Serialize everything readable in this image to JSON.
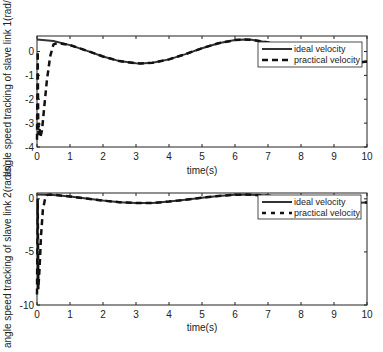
{
  "chart_data": [
    {
      "type": "line",
      "title": "",
      "xlabel": "time(s)",
      "ylabel": "angle speed tracking of slave link 1(rad/s)",
      "xlim": [
        0,
        10
      ],
      "ylim": [
        -4,
        0.65
      ],
      "xticks": [
        0,
        1,
        2,
        3,
        4,
        5,
        6,
        7,
        8,
        9,
        10
      ],
      "yticks": [
        0,
        -1,
        -2,
        -3,
        -4
      ],
      "grid": false,
      "legend_position": "upper right",
      "series": [
        {
          "name": "ideal velocity",
          "style": "solid",
          "x": [
            0,
            0.5,
            1,
            1.5,
            2,
            2.5,
            3,
            3.14,
            3.5,
            4,
            4.5,
            5,
            5.5,
            6,
            6.28,
            6.5,
            7,
            7.5,
            8,
            8.5,
            9,
            9.5,
            10
          ],
          "values": [
            0.5,
            0.44,
            0.27,
            0.04,
            -0.21,
            -0.4,
            -0.49,
            -0.5,
            -0.47,
            -0.33,
            -0.11,
            0.14,
            0.35,
            0.48,
            0.5,
            0.49,
            0.38,
            0.17,
            -0.07,
            -0.3,
            -0.46,
            -0.5,
            -0.42
          ]
        },
        {
          "name": "practical velocity",
          "style": "dashed",
          "x": [
            0,
            0.02,
            0.04,
            0.06,
            0.1,
            0.15,
            0.2,
            0.3,
            0.4,
            0.5,
            0.6,
            0.8,
            1,
            1.5,
            2,
            2.5,
            3,
            3.14,
            3.5,
            4,
            4.5,
            5,
            5.5,
            6,
            6.28,
            6.5,
            7,
            7.5,
            8,
            8.5,
            9,
            9.5,
            10
          ],
          "values": [
            -3.7,
            0.0,
            -3.5,
            -3.0,
            -3.6,
            -3.3,
            -2.6,
            -1.2,
            -0.2,
            0.3,
            0.35,
            0.32,
            0.27,
            0.04,
            -0.21,
            -0.4,
            -0.49,
            -0.5,
            -0.47,
            -0.33,
            -0.11,
            0.14,
            0.35,
            0.48,
            0.5,
            0.49,
            0.38,
            0.17,
            -0.07,
            -0.3,
            -0.46,
            -0.5,
            -0.42
          ]
        }
      ]
    },
    {
      "type": "line",
      "title": "",
      "xlabel": "time(s)",
      "ylabel": "angle speed tracking of slave link 2(rad/s)",
      "xlim": [
        0,
        10
      ],
      "ylim": [
        -10,
        0.55
      ],
      "xticks": [
        0,
        1,
        2,
        3,
        4,
        5,
        6,
        7,
        8,
        9,
        10
      ],
      "yticks": [
        0,
        -5,
        -10
      ],
      "grid": false,
      "legend_position": "upper right",
      "series": [
        {
          "name": "ideal velocity",
          "style": "solid",
          "x": [
            0,
            0.5,
            1,
            1.5,
            2,
            2.5,
            3,
            3.14,
            3.5,
            4,
            4.5,
            5,
            5.5,
            6,
            6.28,
            6.5,
            7,
            7.5,
            8,
            8.5,
            9,
            9.5,
            10
          ],
          "values": [
            0.4,
            0.35,
            0.22,
            0.03,
            -0.17,
            -0.32,
            -0.39,
            -0.4,
            -0.38,
            -0.26,
            -0.09,
            0.11,
            0.28,
            0.38,
            0.4,
            0.39,
            0.3,
            0.14,
            -0.06,
            -0.24,
            -0.37,
            -0.4,
            -0.34
          ]
        },
        {
          "name": "practical velocity",
          "style": "dashed",
          "x": [
            0,
            0.02,
            0.04,
            0.08,
            0.12,
            0.18,
            0.25,
            0.3,
            0.4,
            0.6,
            1,
            1.5,
            2,
            2.5,
            3,
            3.14,
            3.5,
            4,
            4.5,
            5,
            5.5,
            6,
            6.28,
            6.5,
            7,
            7.5,
            8,
            8.5,
            9,
            9.5,
            10
          ],
          "values": [
            -9.0,
            0.0,
            -8.5,
            -6.5,
            -3.5,
            -1.0,
            0.1,
            0.35,
            0.4,
            0.35,
            0.22,
            0.03,
            -0.17,
            -0.32,
            -0.39,
            -0.4,
            -0.38,
            -0.26,
            -0.09,
            0.11,
            0.28,
            0.38,
            0.4,
            0.39,
            0.3,
            0.14,
            -0.06,
            -0.24,
            -0.37,
            -0.4,
            -0.34
          ]
        }
      ]
    }
  ],
  "plots": [
    {
      "xlabel": "time(s)",
      "ylabel": "angle speed tracking of slave link 1(rad/s)",
      "ytick_labels": [
        "0",
        "-1",
        "-2",
        "-3",
        "-4"
      ],
      "xtick_labels": [
        "0",
        "1",
        "2",
        "3",
        "4",
        "5",
        "6",
        "7",
        "8",
        "9",
        "10"
      ],
      "legend": [
        "ideal velocity",
        "practical velocity"
      ]
    },
    {
      "xlabel": "time(s)",
      "ylabel": "angle speed tracking of slave link 2(rad/s)",
      "ytick_labels": [
        "0",
        "-5",
        "-10"
      ],
      "xtick_labels": [
        "0",
        "1",
        "2",
        "3",
        "4",
        "5",
        "6",
        "7",
        "8",
        "9",
        "10"
      ],
      "legend": [
        "ideal velocity",
        "practical velocity"
      ]
    }
  ],
  "colors": {
    "ideal": "#333333",
    "practical": "#111111",
    "axes": "#222222",
    "background": "#ffffff"
  }
}
